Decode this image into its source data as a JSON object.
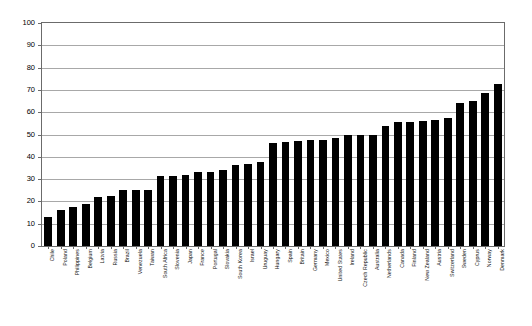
{
  "chart_data": {
    "type": "bar",
    "title": "",
    "subtitle": "",
    "xlabel": "",
    "ylabel": "",
    "ylim": [
      0,
      100
    ],
    "ytick_step": 10,
    "yticks": [
      "0",
      "10",
      "20",
      "30",
      "40",
      "50",
      "60",
      "70",
      "80",
      "90",
      "100"
    ],
    "grid": true,
    "legend": "none",
    "orientation": "vertical",
    "bar_color": "#000000",
    "plot_border_color": "#6B6B6B",
    "gridline_color": "#A8A8A8",
    "background_color": "#FFFFFF",
    "categories": [
      "Chile",
      "Poland",
      "Philippines",
      "Belgium",
      "Latvia",
      "Russia",
      "Brazil",
      "Venezuela",
      "Taiwan",
      "South Africa",
      "Slovenia",
      "Japan",
      "France",
      "Portugal",
      "Slovakia",
      "South Korea",
      "Israel",
      "Uruguay",
      "Hungary",
      "Spain",
      "Britain",
      "Germany",
      "Mexico",
      "United States",
      "Ireland",
      "Czech Republic",
      "Australia",
      "Netherlands",
      "Canada",
      "Finland",
      "New Zealand",
      "Austria",
      "Switzerland",
      "Sweden",
      "Cyprus",
      "Norway",
      "Denmark"
    ],
    "values": [
      13,
      16,
      17.5,
      19,
      22,
      22.5,
      25,
      25,
      25,
      31.5,
      31.5,
      32,
      33,
      33,
      34,
      36.5,
      37,
      37.5,
      46,
      46.5,
      47,
      47.5,
      47.5,
      48.5,
      50,
      50,
      50,
      54,
      55.5,
      55.5,
      56,
      56.5,
      57.5,
      64,
      65,
      68.5,
      72.5
    ],
    "n_bars": 42,
    "note_duplicate_categories": []
  },
  "axis": {
    "y_min_label": "0",
    "y_max_label": "100"
  }
}
